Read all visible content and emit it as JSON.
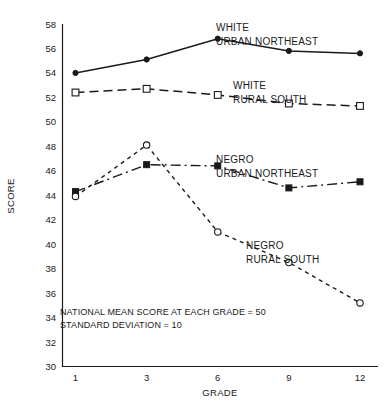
{
  "chart_data": {
    "type": "line",
    "title": "",
    "xlabel": "GRADE",
    "ylabel": "SCORE",
    "categories": [
      "1",
      "3",
      "6",
      "9",
      "12"
    ],
    "x": [
      1,
      3,
      6,
      9,
      12
    ],
    "ylim": [
      30,
      58
    ],
    "yticks": [
      30,
      32,
      34,
      36,
      38,
      40,
      42,
      44,
      46,
      48,
      50,
      52,
      54,
      56,
      58
    ],
    "ytick_labels": [
      "30",
      "32",
      "34",
      "36",
      "38",
      "40",
      "42",
      "44",
      "46",
      "48",
      "50",
      "52",
      "54",
      "56",
      "58"
    ],
    "xtick_labels": [
      "1",
      "3",
      "6",
      "9",
      "12"
    ],
    "grid": false,
    "legend_position": "inline-right",
    "series": [
      {
        "name": "WHITE URBAN NORTHEAST",
        "label_line1": "WHITE",
        "label_line2": "URBAN NORTHEAST",
        "marker": "filled-circle",
        "linestyle": "solid",
        "color": "#1a1a1a",
        "values": [
          54.0,
          55.1,
          56.8,
          55.8,
          55.6
        ]
      },
      {
        "name": "WHITE RURAL SOUTH",
        "label_line1": "WHITE",
        "label_line2": "RURAL SOUTH",
        "marker": "open-square",
        "linestyle": "dashed",
        "color": "#1a1a1a",
        "values": [
          52.4,
          52.7,
          52.2,
          51.5,
          51.3
        ]
      },
      {
        "name": "NEGRO URBAN NORTHEAST",
        "label_line1": "NEGRO",
        "label_line2": "URBAN NORTHEAST",
        "marker": "filled-square",
        "linestyle": "dash-dot",
        "color": "#1a1a1a",
        "values": [
          44.3,
          46.5,
          46.4,
          44.6,
          45.1
        ]
      },
      {
        "name": "NEGRO RURAL SOUTH",
        "label_line1": "NEGRO",
        "label_line2": "RURAL SOUTH",
        "marker": "open-circle",
        "linestyle": "dotted",
        "color": "#1a1a1a",
        "values": [
          43.9,
          48.1,
          41.0,
          38.5,
          35.2
        ]
      }
    ],
    "annotations": [
      "NATIONAL MEAN SCORE AT EACH GRADE = 50",
      "STANDARD DEVIATION = 10"
    ]
  }
}
